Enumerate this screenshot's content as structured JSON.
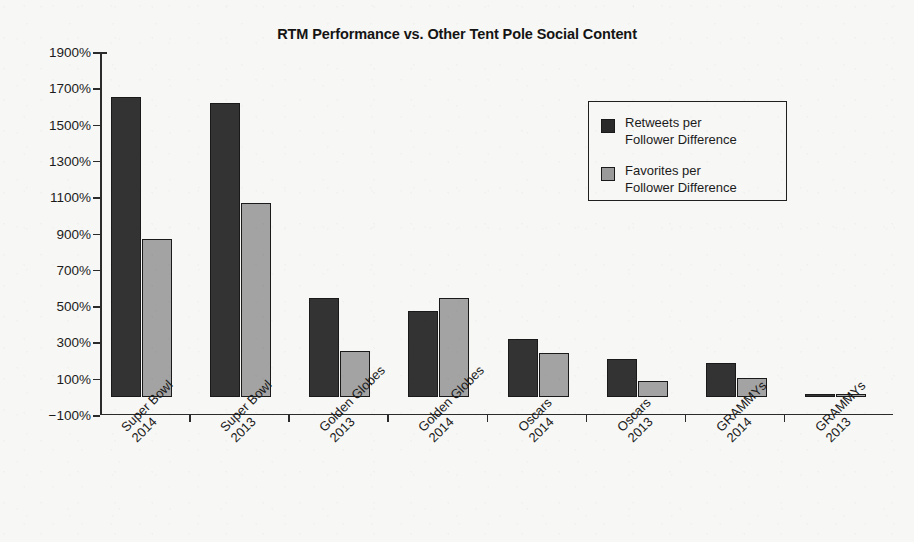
{
  "chart_data": {
    "type": "bar",
    "title": "RTM Performance vs. Other Tent Pole Social Content",
    "xlabel": "",
    "ylabel": "",
    "ylim": [
      -100,
      1900
    ],
    "ytick_step": 200,
    "ytick_labels": [
      "1900%",
      "1700%",
      "1500%",
      "1300%",
      "1100%",
      "900%",
      "700%",
      "500%",
      "300%",
      "100%",
      "-100%"
    ],
    "ytick_values": [
      1900,
      1700,
      1500,
      1300,
      1100,
      900,
      700,
      500,
      300,
      100,
      -100
    ],
    "grid": false,
    "legend_position": "upper right",
    "categories": [
      "Super Bowl 2014",
      "Super Bowl 2013",
      "Golden Globes 2013",
      "Golden Globes 2014",
      "Oscars 2014",
      "Oscars 2013",
      "GRAMMYs 2014",
      "GRAMMYs 2013"
    ],
    "category_lines": [
      [
        "Super Bowl",
        "2014"
      ],
      [
        "Super Bowl",
        "2013"
      ],
      [
        "Golden Globes",
        "2013"
      ],
      [
        "Golden Globes",
        "2014"
      ],
      [
        "Oscars",
        "2014"
      ],
      [
        "Oscars",
        "2013"
      ],
      [
        "GRAMMYs",
        "2014"
      ],
      [
        "GRAMMYs",
        "2013"
      ]
    ],
    "series": [
      {
        "name": "Retweets per Follower Difference",
        "color": "#333333",
        "values": [
          1650,
          1620,
          545,
          475,
          320,
          210,
          185,
          5
        ]
      },
      {
        "name": "Favorites per Follower Difference",
        "color": "#a3a3a3",
        "values": [
          870,
          1070,
          250,
          545,
          240,
          85,
          105,
          15
        ]
      }
    ]
  },
  "legend": {
    "items": [
      {
        "label_line1": "Retweets per",
        "label_line2": "Follower Difference",
        "color": "#2a2a2a"
      },
      {
        "label_line1": "Favorites per",
        "label_line2": "Follower Difference",
        "color": "#9a9a9a"
      }
    ]
  },
  "colors": {
    "background": "#f7f7f5",
    "axis": "#2b2b2b",
    "text": "#1b1b1b",
    "series_dark": "#333333",
    "series_light": "#a3a3a3"
  }
}
